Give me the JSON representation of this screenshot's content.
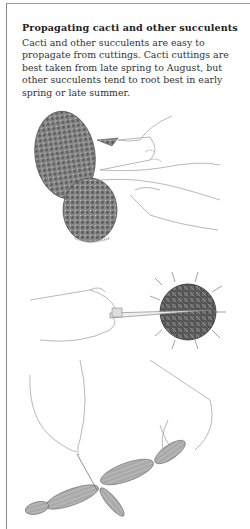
{
  "page": {
    "heading": "Propagating cacti and other succulents",
    "paragraph": "Cacti and other succulents are easy to propagate from cuttings. Cacti cuttings are best taken from late spring to August, but other succulents tend to root best in early spring or late summer."
  },
  "illustrations": [
    {
      "name": "opuntia-pad-cutting",
      "description": "Hands detaching a pad from a prickly-pear cactus"
    },
    {
      "name": "round-cactus-offset-cutting",
      "description": "Hand with knife removing an offset from a globular spiny cactus"
    },
    {
      "name": "jointed-succulent-stem-cutting",
      "description": "Two hands separating segments of a jointed succulent stem"
    }
  ]
}
